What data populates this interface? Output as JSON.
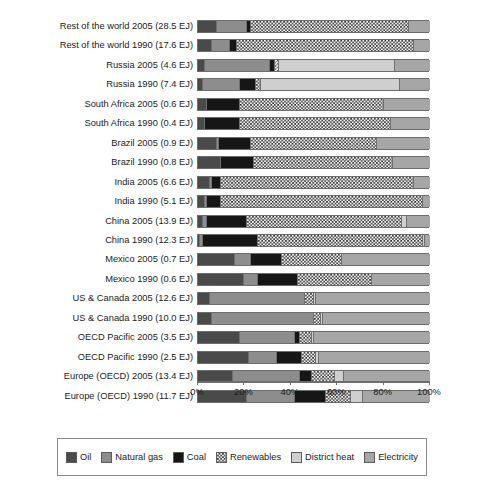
{
  "chart_data": {
    "type": "bar",
    "orientation": "horizontal",
    "stacked": true,
    "title": "",
    "xlabel": "",
    "ylabel": "",
    "xlim": [
      0,
      100
    ],
    "xunit": "%",
    "grid": false,
    "legend_position": "bottom",
    "xtick_labels": [
      "0%",
      "20%",
      "40%",
      "60%",
      "80%",
      "100%"
    ],
    "xtick_values": [
      0,
      20,
      40,
      60,
      80,
      100
    ],
    "series": [
      {
        "name": "Oil",
        "color": "#4a4a4a",
        "pattern": "solid-dark-gray"
      },
      {
        "name": "Natural gas",
        "color": "#8d8d8d",
        "pattern": "solid-mid-gray"
      },
      {
        "name": "Coal",
        "color": "#161616",
        "pattern": "solid-black"
      },
      {
        "name": "Renewables",
        "color": "#3a3a3a",
        "pattern": "checkerboard"
      },
      {
        "name": "District heat",
        "color": "#cfcfcf",
        "pattern": "solid-light-gray"
      },
      {
        "name": "Electricity",
        "color": "#a6a6a6",
        "pattern": "solid-gray"
      }
    ],
    "categories": [
      "Rest of the world 2005 (28.5 EJ)",
      "Rest of the world 1990 (17.6 EJ)",
      "Russia 2005 (4.6 EJ)",
      "Russia 1990 (7.4 EJ)",
      "South Africa 2005 (0.6 EJ)",
      "South Africa 1990 (0.4 EJ)",
      "Brazil 2005 (0.9 EJ)",
      "Brazil 1990 (0.8 EJ)",
      "India 2005 (6.6 EJ)",
      "India 1990 (5.1 EJ)",
      "China 2005 (13.9 EJ)",
      "China 1990 (12.3 EJ)",
      "Mexico 2005 (0.7 EJ)",
      "Mexico 1990 (0.6 EJ)",
      "US & Canada 2005 (12.6 EJ)",
      "US & Canada 1990 (10.0 EJ)",
      "OECD Pacific 2005 (3.5 EJ)",
      "OECD Pacific 1990 (2.5 EJ)",
      "Europe (OECD) 2005 (13.4 EJ)",
      "Europe (OECD) 1990 (11.7 EJ)"
    ],
    "rows": [
      {
        "label": "Rest of the world 2005 (28.5 EJ)",
        "values": {
          "Oil": 8,
          "Natural gas": 13,
          "Coal": 2,
          "Renewables": 68,
          "District heat": 0,
          "Electricity": 9
        }
      },
      {
        "label": "Rest of the world 1990 (17.6 EJ)",
        "values": {
          "Oil": 6,
          "Natural gas": 8,
          "Coal": 3,
          "Renewables": 76,
          "District heat": 0,
          "Electricity": 7
        }
      },
      {
        "label": "Russia 2005 (4.6 EJ)",
        "values": {
          "Oil": 3,
          "Natural gas": 28,
          "Coal": 2,
          "Renewables": 2,
          "District heat": 50,
          "Electricity": 15
        }
      },
      {
        "label": "Russia 1990 (7.4 EJ)",
        "values": {
          "Oil": 2,
          "Natural gas": 16,
          "Coal": 7,
          "Renewables": 2,
          "District heat": 60,
          "Electricity": 13
        }
      },
      {
        "label": "South Africa 2005 (0.6 EJ)",
        "values": {
          "Oil": 4,
          "Natural gas": 0,
          "Coal": 14,
          "Renewables": 62,
          "District heat": 0,
          "Electricity": 20
        }
      },
      {
        "label": "South Africa 1990 (0.4 EJ)",
        "values": {
          "Oil": 3,
          "Natural gas": 0,
          "Coal": 15,
          "Renewables": 65,
          "District heat": 0,
          "Electricity": 17
        }
      },
      {
        "label": "Brazil 2005 (0.9 EJ)",
        "values": {
          "Oil": 8,
          "Natural gas": 1,
          "Coal": 14,
          "Renewables": 54,
          "District heat": 0,
          "Electricity": 23
        }
      },
      {
        "label": "Brazil 1990 (0.8 EJ)",
        "values": {
          "Oil": 10,
          "Natural gas": 0,
          "Coal": 14,
          "Renewables": 60,
          "District heat": 0,
          "Electricity": 16
        }
      },
      {
        "label": "India 2005 (6.6 EJ)",
        "values": {
          "Oil": 5,
          "Natural gas": 1,
          "Coal": 4,
          "Renewables": 83,
          "District heat": 0,
          "Electricity": 7
        }
      },
      {
        "label": "India 1990 (5.1 EJ)",
        "values": {
          "Oil": 3,
          "Natural gas": 1,
          "Coal": 6,
          "Renewables": 87,
          "District heat": 0,
          "Electricity": 3
        }
      },
      {
        "label": "China 2005 (13.9 EJ)",
        "values": {
          "Oil": 2,
          "Natural gas": 2,
          "Coal": 17,
          "Renewables": 67,
          "District heat": 2,
          "Electricity": 10
        }
      },
      {
        "label": "China 1990 (12.3 EJ)",
        "values": {
          "Oil": 1,
          "Natural gas": 1,
          "Coal": 24,
          "Renewables": 71,
          "District heat": 1,
          "Electricity": 2
        }
      },
      {
        "label": "Mexico 2005 (0.7 EJ)",
        "values": {
          "Oil": 16,
          "Natural gas": 7,
          "Coal": 13,
          "Renewables": 26,
          "District heat": 0,
          "Electricity": 38
        }
      },
      {
        "label": "Mexico 1990 (0.6 EJ)",
        "values": {
          "Oil": 20,
          "Natural gas": 6,
          "Coal": 17,
          "Renewables": 32,
          "District heat": 0,
          "Electricity": 25
        }
      },
      {
        "label": "US & Canada 2005 (12.6 EJ)",
        "values": {
          "Oil": 5,
          "Natural gas": 41,
          "Coal": 0,
          "Renewables": 4,
          "District heat": 1,
          "Electricity": 49
        }
      },
      {
        "label": "US & Canada 1990 (10.0 EJ)",
        "values": {
          "Oil": 6,
          "Natural gas": 44,
          "Coal": 0,
          "Renewables": 3,
          "District heat": 1,
          "Electricity": 46
        }
      },
      {
        "label": "OECD Pacific 2005 (3.5 EJ)",
        "values": {
          "Oil": 18,
          "Natural gas": 24,
          "Coal": 2,
          "Renewables": 5,
          "District heat": 1,
          "Electricity": 50
        }
      },
      {
        "label": "OECD Pacific 1990 (2.5 EJ)",
        "values": {
          "Oil": 22,
          "Natural gas": 12,
          "Coal": 11,
          "Renewables": 6,
          "District heat": 1,
          "Electricity": 48
        }
      },
      {
        "label": "Europe (OECD) 2005 (13.4 EJ)",
        "values": {
          "Oil": 15,
          "Natural gas": 29,
          "Coal": 5,
          "Renewables": 10,
          "District heat": 4,
          "Electricity": 37
        }
      },
      {
        "label": "Europe (OECD) 1990 (11.7 EJ)",
        "values": {
          "Oil": 21,
          "Natural gas": 21,
          "Coal": 13,
          "Renewables": 11,
          "District heat": 5,
          "Electricity": 29
        }
      }
    ]
  },
  "legend": {
    "items": [
      {
        "label": "Oil",
        "key": "Oil"
      },
      {
        "label": "Natural gas",
        "key": "Natural gas"
      },
      {
        "label": "Coal",
        "key": "Coal"
      },
      {
        "label": "Renewables",
        "key": "Renewables"
      },
      {
        "label": "District heat",
        "key": "District heat"
      },
      {
        "label": "Electricity",
        "key": "Electricity"
      }
    ]
  }
}
